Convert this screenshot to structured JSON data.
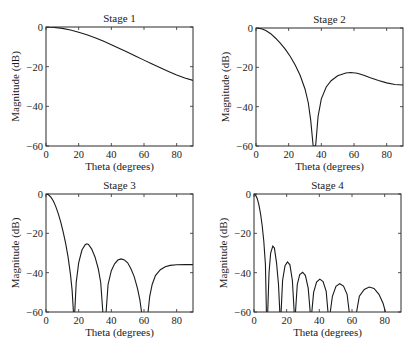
{
  "chart_data": [
    {
      "type": "line",
      "title": "Stage 1",
      "xlabel": "Theta (degrees)",
      "ylabel": "Magnitude (dB)",
      "xlim": [
        0,
        90
      ],
      "ylim": [
        -60,
        0
      ],
      "xticks": [
        0,
        20,
        40,
        60,
        80
      ],
      "yticks": [
        0,
        -20,
        -40,
        -60
      ],
      "grid": false,
      "series": [
        {
          "name": "Stage 1",
          "x": [
            0,
            5,
            10,
            15,
            20,
            25,
            30,
            35,
            40,
            45,
            50,
            55,
            60,
            65,
            70,
            75,
            80,
            85,
            90
          ],
          "y": [
            0,
            -0.2,
            -0.7,
            -1.5,
            -2.6,
            -3.9,
            -5.4,
            -7.1,
            -8.9,
            -10.8,
            -12.7,
            -14.7,
            -16.7,
            -18.7,
            -20.6,
            -22.4,
            -24.2,
            -25.7,
            -26.9
          ]
        }
      ]
    },
    {
      "type": "line",
      "title": "Stage 2",
      "xlabel": "Theta (degrees)",
      "ylabel": "Magnitude (dB)",
      "xlim": [
        0,
        90
      ],
      "ylim": [
        -60,
        0
      ],
      "xticks": [
        0,
        20,
        40,
        60,
        80
      ],
      "yticks": [
        0,
        -20,
        -40,
        -60
      ],
      "grid": false,
      "series": [
        {
          "name": "Stage 2",
          "x": [
            0,
            3,
            6,
            9,
            12,
            15,
            18,
            21,
            24,
            27,
            30,
            32,
            33.5,
            35,
            36.5,
            38,
            40,
            43,
            46,
            50,
            55,
            58,
            62,
            66,
            70,
            75,
            80,
            85,
            90
          ],
          "y": [
            0,
            -0.3,
            -1.3,
            -2.9,
            -5.2,
            -7.8,
            -10.9,
            -14.5,
            -18.8,
            -24.0,
            -31.0,
            -38.0,
            -47.0,
            -60,
            -60,
            -45.0,
            -36.0,
            -30.0,
            -26.8,
            -24.3,
            -22.9,
            -22.6,
            -23.0,
            -24.0,
            -25.3,
            -26.7,
            -27.9,
            -28.7,
            -29.0
          ]
        }
      ]
    },
    {
      "type": "line",
      "title": "Stage 3",
      "xlabel": "Theta (degrees)",
      "ylabel": "Magnitude (dB)",
      "xlim": [
        0,
        90
      ],
      "ylim": [
        -60,
        0
      ],
      "xticks": [
        0,
        20,
        40,
        60,
        80
      ],
      "yticks": [
        0,
        -20,
        -40,
        -60
      ],
      "grid": false,
      "series": [
        {
          "name": "Stage 3",
          "x": [
            0,
            1.5,
            3,
            4.5,
            6,
            7.5,
            9,
            10.5,
            12,
            13.5,
            15,
            16,
            16.8,
            null,
            17.6,
            18.5,
            20,
            22,
            24,
            25,
            26,
            28,
            30,
            32,
            33.5,
            34.8,
            null,
            36.8,
            38,
            40,
            42,
            44,
            46,
            48,
            50,
            52,
            54,
            56,
            57.5,
            58.5,
            null,
            62.5,
            63.5,
            65,
            67,
            70,
            73,
            76,
            80,
            85,
            90
          ],
          "y": [
            0,
            -0.4,
            -1.6,
            -3.6,
            -6.4,
            -10.0,
            -14.2,
            -19.2,
            -25.0,
            -32.0,
            -41.0,
            -49.0,
            -60,
            null,
            -60,
            -45.0,
            -35.0,
            -28.5,
            -25.8,
            -25.3,
            -25.7,
            -28.0,
            -32.0,
            -38.0,
            -45.0,
            -60,
            null,
            -60,
            -46.0,
            -39.0,
            -35.5,
            -33.6,
            -33.0,
            -33.5,
            -35.0,
            -38.0,
            -42.0,
            -48.0,
            -54.0,
            -60,
            null,
            -60,
            -52.0,
            -46.0,
            -41.5,
            -38.5,
            -37.0,
            -36.3,
            -36.0,
            -35.9,
            -35.9
          ]
        }
      ]
    },
    {
      "type": "line",
      "title": "Stage 4",
      "xlabel": "Theta (degrees)",
      "ylabel": "Magnitude (dB)",
      "xlim": [
        0,
        90
      ],
      "ylim": [
        -60,
        0
      ],
      "xticks": [
        0,
        20,
        40,
        60,
        80
      ],
      "yticks": [
        0,
        -20,
        -40,
        -60
      ],
      "grid": false,
      "series": [
        {
          "name": "Stage 4",
          "x": [
            0,
            1,
            2,
            3,
            4,
            5,
            6,
            7,
            7.6,
            null,
            8.4,
            9.2,
            10.2,
            11.5,
            12.5,
            13.8,
            15,
            15.8,
            null,
            16.6,
            17.5,
            19,
            20.5,
            22,
            23.5,
            24.6,
            null,
            25.4,
            26.5,
            28,
            29.8,
            31.5,
            33.2,
            34.4,
            null,
            35.4,
            36.5,
            38.3,
            40.3,
            42.3,
            44.2,
            45.3,
            null,
            46.7,
            48,
            50.2,
            52.5,
            54.8,
            57,
            58.3,
            null,
            62.8,
            64.5,
            67.5,
            70.5,
            73.5,
            76.5,
            79,
            80.5
          ],
          "y": [
            0,
            -0.6,
            -2.4,
            -5.5,
            -10.0,
            -16.0,
            -24.0,
            -36.0,
            -60,
            null,
            -60,
            -40.0,
            -30.0,
            -26.5,
            -27.5,
            -35.0,
            -46.0,
            -60,
            null,
            -60,
            -44.0,
            -36.5,
            -34.5,
            -36.0,
            -44.0,
            -60,
            null,
            -60,
            -46.0,
            -41.0,
            -39.8,
            -41.5,
            -48.0,
            -60,
            null,
            -60,
            -50.0,
            -44.8,
            -43.3,
            -44.5,
            -49.5,
            -60,
            null,
            -60,
            -52.0,
            -47.0,
            -45.6,
            -46.8,
            -51.0,
            -60,
            null,
            -60,
            -52.0,
            -48.5,
            -47.3,
            -48.0,
            -51.0,
            -55.5,
            -60
          ]
        }
      ]
    }
  ]
}
